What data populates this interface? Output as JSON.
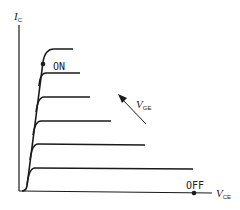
{
  "axes": {
    "y_label": "I",
    "y_sub": "C",
    "x_label": "V",
    "x_sub": "CE"
  },
  "annotations": {
    "on_label": "ON",
    "off_label": "OFF",
    "arrow_label": "V",
    "arrow_sub": "GE"
  },
  "curves": [
    {
      "level": 1,
      "flat_y": 191,
      "end_x": 193
    },
    {
      "level": 2,
      "flat_y": 168,
      "end_x": 193
    },
    {
      "level": 3,
      "flat_y": 144,
      "end_x": 145
    },
    {
      "level": 4,
      "flat_y": 121,
      "end_x": 111
    },
    {
      "level": 5,
      "flat_y": 97,
      "end_x": 90
    },
    {
      "level": 6,
      "flat_y": 73,
      "end_x": 80
    },
    {
      "level": 7,
      "flat_y": 49,
      "end_x": 73
    }
  ],
  "colors": {
    "line": "#1a1a1a",
    "background": "#ffffff"
  }
}
